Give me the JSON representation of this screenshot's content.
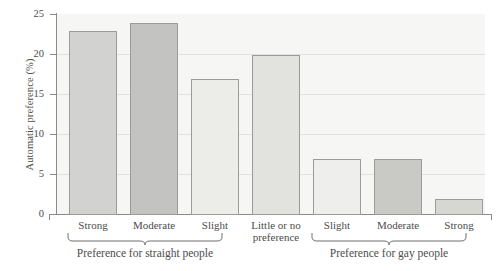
{
  "chart_data": {
    "type": "bar",
    "title": "",
    "xlabel": "",
    "ylabel": "Automatic preference (%)",
    "ylim": [
      0,
      25
    ],
    "yticks": [
      0,
      5,
      10,
      15,
      20,
      25
    ],
    "ytick_labels": [
      "0",
      "5",
      "10",
      "15",
      "20",
      "25"
    ],
    "grid": true,
    "legend": "none",
    "categories": [
      "Strong",
      "Moderate",
      "Slight",
      "Little or no preference",
      "Slight",
      "Moderate",
      "Strong"
    ],
    "values": [
      23,
      24,
      17,
      20,
      7,
      7,
      2
    ],
    "bar_colors": [
      "#d2d2d0",
      "#c3c3c1",
      "#ecece9",
      "#e2e2df",
      "#eeeeec",
      "#c9c9c6",
      "#d6d6d3"
    ],
    "groups": [
      {
        "label": "Preference for straight people",
        "members": [
          "Strong",
          "Moderate",
          "Slight"
        ]
      },
      {
        "label": "Preference for gay people",
        "members": [
          "Slight",
          "Moderate",
          "Strong"
        ]
      }
    ]
  },
  "axis": {
    "y_title": "Automatic preference (%)",
    "y_ticks": [
      "25",
      "20",
      "15",
      "10",
      "5",
      "0"
    ]
  },
  "bars": [
    {
      "label": "Strong",
      "value": 23,
      "label_line1": "Strong",
      "label_line2": ""
    },
    {
      "label": "Moderate",
      "value": 24,
      "label_line1": "Moderate",
      "label_line2": ""
    },
    {
      "label": "Slight",
      "value": 17,
      "label_line1": "Slight",
      "label_line2": ""
    },
    {
      "label": "Little or no preference",
      "value": 20,
      "label_line1": "Little or no",
      "label_line2": "preference"
    },
    {
      "label": "Slight",
      "value": 7,
      "label_line1": "Slight",
      "label_line2": ""
    },
    {
      "label": "Moderate",
      "value": 7,
      "label_line1": "Moderate",
      "label_line2": ""
    },
    {
      "label": "Strong",
      "value": 2,
      "label_line1": "Strong",
      "label_line2": ""
    }
  ],
  "groups": {
    "left_label": "Preference for straight people",
    "right_label": "Preference for gay people"
  },
  "colors": {
    "plot_background": "#f6f6f4",
    "axis": "#8a8a8a",
    "gridline": "#e2e2dd",
    "text": "#4c4c4c",
    "bar_border": "#9b9b9b"
  }
}
